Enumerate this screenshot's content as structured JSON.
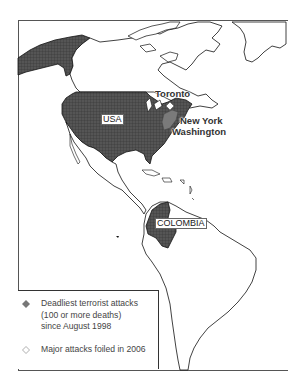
{
  "map": {
    "region": "North and South America",
    "colors": {
      "country_fill": "#555555",
      "highlight_fill": "#7a7a7a",
      "outline": "#111111",
      "frame": "#333333",
      "background": "#ffffff"
    },
    "labels": {
      "usa": "USA",
      "colombia": "COLOMBIA",
      "toronto": "Toronto",
      "new_york": "New York",
      "washington": "Washington"
    },
    "highlighted_countries": [
      "USA",
      "COLOMBIA"
    ],
    "markers": [
      {
        "city": "Toronto",
        "type": "foiled",
        "symbol": "open-diamond"
      },
      {
        "city": "New York / Washington",
        "type": "deadliest",
        "symbol": "filled-diamond"
      }
    ]
  },
  "legend": {
    "items": [
      {
        "symbol": "filled-diamond-icon",
        "lines": [
          "Deadliest terrorist attacks",
          "(100 or more deaths)",
          "since August 1998"
        ]
      },
      {
        "symbol": "open-diamond-icon",
        "lines": [
          "Major attacks foiled in 2006"
        ]
      }
    ]
  }
}
